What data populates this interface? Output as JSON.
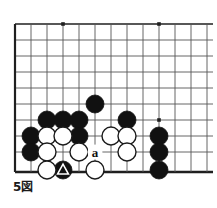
{
  "figure": {
    "caption": "5図",
    "kind": "go-board-diagram",
    "board": {
      "origin_x": 15,
      "origin_y": 24,
      "spacing": 16,
      "cols": 13,
      "rows": 10,
      "bottom_edge_y": 172,
      "right_edge_x": 213,
      "line_color": "#555555",
      "edge_color": "#1f1f1f",
      "background": "#ffffff",
      "stone_radius": 9
    },
    "star_points": [
      {
        "x": 63,
        "y": 24
      },
      {
        "x": 159,
        "y": 24
      },
      {
        "x": 159,
        "y": 120
      }
    ],
    "stones": [
      {
        "color": "black",
        "x": 95,
        "y": 104,
        "mark": "none"
      },
      {
        "color": "black",
        "x": 47,
        "y": 120,
        "mark": "none"
      },
      {
        "color": "black",
        "x": 63,
        "y": 120,
        "mark": "none"
      },
      {
        "color": "black",
        "x": 79,
        "y": 120,
        "mark": "none"
      },
      {
        "color": "black",
        "x": 127,
        "y": 120,
        "mark": "none"
      },
      {
        "color": "black",
        "x": 31,
        "y": 136,
        "mark": "none"
      },
      {
        "color": "black",
        "x": 79,
        "y": 136,
        "mark": "none"
      },
      {
        "color": "black",
        "x": 159,
        "y": 136,
        "mark": "none"
      },
      {
        "color": "black",
        "x": 31,
        "y": 152,
        "mark": "none"
      },
      {
        "color": "black",
        "x": 159,
        "y": 152,
        "mark": "none"
      },
      {
        "color": "black",
        "x": 63,
        "y": 170,
        "mark": "triangle"
      },
      {
        "color": "black",
        "x": 159,
        "y": 170,
        "mark": "none"
      },
      {
        "color": "white",
        "x": 47,
        "y": 136,
        "mark": "none"
      },
      {
        "color": "white",
        "x": 63,
        "y": 136,
        "mark": "none"
      },
      {
        "color": "white",
        "x": 111,
        "y": 136,
        "mark": "none"
      },
      {
        "color": "white",
        "x": 127,
        "y": 136,
        "mark": "none"
      },
      {
        "color": "white",
        "x": 47,
        "y": 152,
        "mark": "none"
      },
      {
        "color": "white",
        "x": 79,
        "y": 152,
        "mark": "none"
      },
      {
        "color": "white",
        "x": 127,
        "y": 152,
        "mark": "none"
      },
      {
        "color": "white",
        "x": 47,
        "y": 170,
        "mark": "none"
      },
      {
        "color": "white",
        "x": 95,
        "y": 170,
        "mark": "none"
      }
    ],
    "labels": [
      {
        "text": "a",
        "x": 95,
        "y": 152,
        "color": "#111111"
      }
    ],
    "colors": {
      "black_stone": "#111111",
      "white_stone_fill": "#ffffff",
      "white_stone_stroke": "#1b1b1b",
      "triangle_fill": "#ffffff",
      "grid": "#555555",
      "edge": "#1f1f1f"
    }
  }
}
